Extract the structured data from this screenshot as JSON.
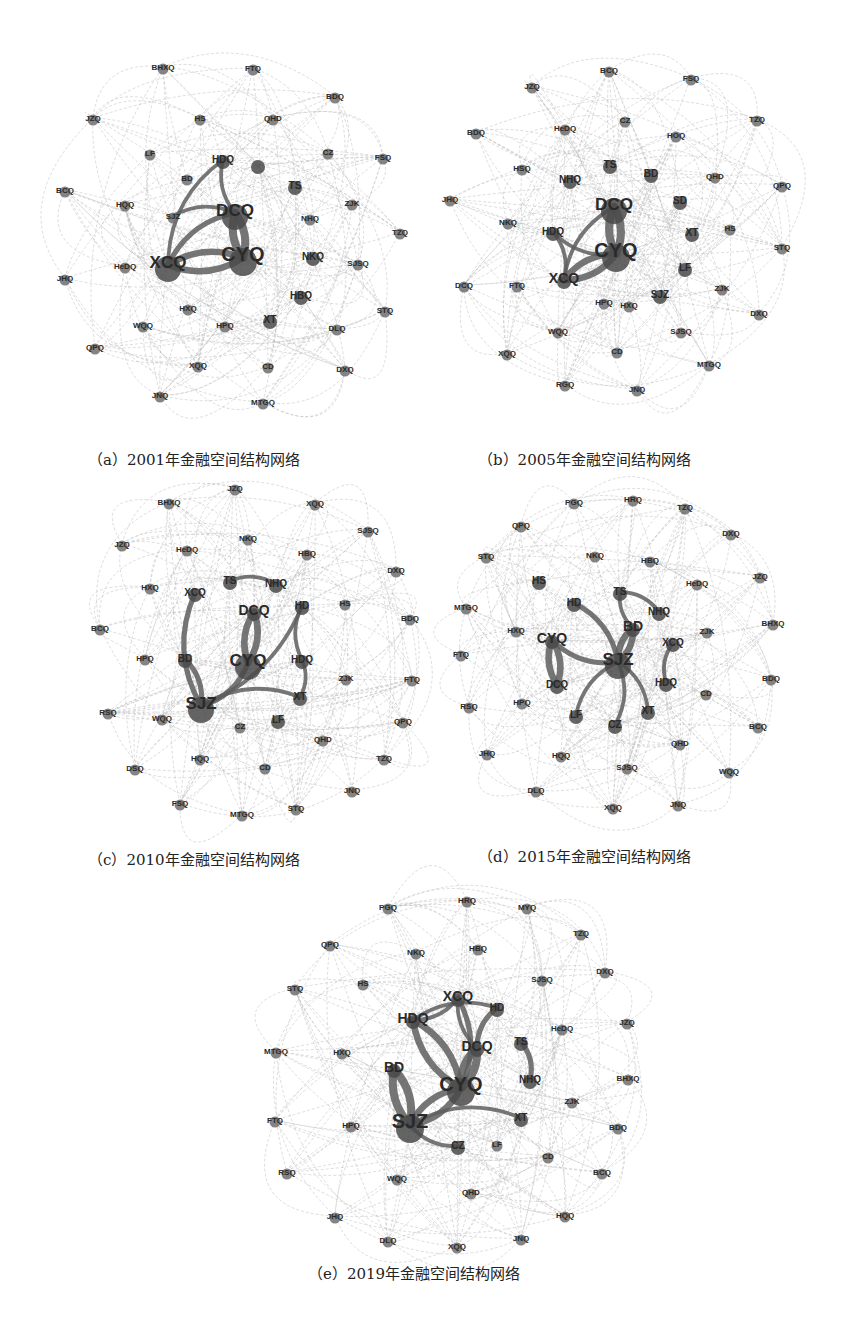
{
  "figure": {
    "panels": [
      {
        "id": "a",
        "caption": "（a）2001年金融空间结构网络",
        "year": 2001,
        "nodes": [
          {
            "label": "BHXQ",
            "w": 1
          },
          {
            "label": "FTQ",
            "w": 1
          },
          {
            "label": "BDQ",
            "w": 1
          },
          {
            "label": "JZQ",
            "w": 1
          },
          {
            "label": "HS",
            "w": 1
          },
          {
            "label": "QHD",
            "w": 1
          },
          {
            "label": "LF",
            "w": 1
          },
          {
            "label": "HDQ",
            "w": 2
          },
          {
            "label": "",
            "w": 2
          },
          {
            "label": "CZ",
            "w": 1
          },
          {
            "label": "FSQ",
            "w": 1
          },
          {
            "label": "BD",
            "w": 1
          },
          {
            "label": "TS",
            "w": 2
          },
          {
            "label": "BCQ",
            "w": 1
          },
          {
            "label": "HQQ",
            "w": 1
          },
          {
            "label": "SJZ",
            "w": 1
          },
          {
            "label": "DCQ",
            "w": 4
          },
          {
            "label": "ZJK",
            "w": 1
          },
          {
            "label": "NHQ",
            "w": 1
          },
          {
            "label": "TZQ",
            "w": 1
          },
          {
            "label": "XCQ",
            "w": 4
          },
          {
            "label": "CYQ",
            "w": 5
          },
          {
            "label": "JHQ",
            "w": 1
          },
          {
            "label": "HeDQ",
            "w": 1
          },
          {
            "label": "NKQ",
            "w": 2
          },
          {
            "label": "SJSQ",
            "w": 1
          },
          {
            "label": "HBQ",
            "w": 2
          },
          {
            "label": "HXQ",
            "w": 1
          },
          {
            "label": "STQ",
            "w": 1
          },
          {
            "label": "WQQ",
            "w": 1
          },
          {
            "label": "HPQ",
            "w": 1
          },
          {
            "label": "XT",
            "w": 2
          },
          {
            "label": "DLQ",
            "w": 1
          },
          {
            "label": "QPQ",
            "w": 1
          },
          {
            "label": "XQQ",
            "w": 1
          },
          {
            "label": "CD",
            "w": 1
          },
          {
            "label": "DXQ",
            "w": 1
          },
          {
            "label": "JNQ",
            "w": 1
          },
          {
            "label": "MTGQ",
            "w": 1
          }
        ],
        "strong_edges": [
          [
            "DCQ",
            "CYQ",
            5
          ],
          [
            "XCQ",
            "CYQ",
            4
          ],
          [
            "XCQ",
            "DCQ",
            3
          ],
          [
            "HDQ",
            "DCQ",
            2
          ],
          [
            "SJZ",
            "DCQ",
            2
          ],
          [
            "HDQ",
            "XCQ",
            2
          ]
        ]
      },
      {
        "id": "b",
        "caption": "（b）2005年金融空间结构网络",
        "year": 2005,
        "nodes": [
          {
            "label": "BCQ",
            "w": 1
          },
          {
            "label": "JZQ",
            "w": 1
          },
          {
            "label": "FSQ",
            "w": 1
          },
          {
            "label": "HeDQ",
            "w": 1
          },
          {
            "label": "CZ",
            "w": 1
          },
          {
            "label": "BDQ",
            "w": 1
          },
          {
            "label": "HOQ",
            "w": 1
          },
          {
            "label": "TZQ",
            "w": 1
          },
          {
            "label": "HSQ",
            "w": 1
          },
          {
            "label": "TS",
            "w": 2
          },
          {
            "label": "NHQ",
            "w": 2
          },
          {
            "label": "BD",
            "w": 2
          },
          {
            "label": "QHD",
            "w": 1
          },
          {
            "label": "QPQ",
            "w": 1
          },
          {
            "label": "JHQ",
            "w": 1
          },
          {
            "label": "SD",
            "w": 2
          },
          {
            "label": "DCQ",
            "w": 4
          },
          {
            "label": "NKQ",
            "w": 1
          },
          {
            "label": "HDQ",
            "w": 2
          },
          {
            "label": "HS",
            "w": 1
          },
          {
            "label": "XT",
            "w": 2
          },
          {
            "label": "CYQ",
            "w": 5
          },
          {
            "label": "STQ",
            "w": 1
          },
          {
            "label": "XCQ",
            "w": 3
          },
          {
            "label": "LF",
            "w": 2
          },
          {
            "label": "ZJK",
            "w": 1
          },
          {
            "label": "DCQ2",
            "w": 1
          },
          {
            "label": "FTQ",
            "w": 1
          },
          {
            "label": "HPQ",
            "w": 1
          },
          {
            "label": "HXQ",
            "w": 1
          },
          {
            "label": "SJZ",
            "w": 2
          },
          {
            "label": "DXQ",
            "w": 1
          },
          {
            "label": "WQQ",
            "w": 1
          },
          {
            "label": "SJSQ",
            "w": 1
          },
          {
            "label": "XQQ",
            "w": 1
          },
          {
            "label": "CD",
            "w": 1
          },
          {
            "label": "MTGQ",
            "w": 1
          },
          {
            "label": "RGQ",
            "w": 1
          },
          {
            "label": "JNQ",
            "w": 1
          }
        ],
        "strong_edges": [
          [
            "DCQ",
            "CYQ",
            5
          ],
          [
            "XCQ",
            "CYQ",
            4
          ],
          [
            "HDQ",
            "XCQ",
            2
          ],
          [
            "HDQ",
            "CYQ",
            2
          ],
          [
            "XCQ",
            "DCQ",
            2
          ]
        ]
      },
      {
        "id": "c",
        "caption": "（c）2010年金融空间结构网络",
        "year": 2010,
        "nodes": [
          {
            "label": "JZQ",
            "w": 1
          },
          {
            "label": "BHXQ",
            "w": 1
          },
          {
            "label": "XQQ",
            "w": 1
          },
          {
            "label": "NKQ",
            "w": 1
          },
          {
            "label": "SJSQ",
            "w": 1
          },
          {
            "label": "JZQ2",
            "w": 1
          },
          {
            "label": "HeDQ",
            "w": 1
          },
          {
            "label": "HBQ",
            "w": 1
          },
          {
            "label": "DXQ",
            "w": 1
          },
          {
            "label": "TS",
            "w": 2
          },
          {
            "label": "NHQ",
            "w": 2
          },
          {
            "label": "HXQ",
            "w": 1
          },
          {
            "label": "XCQ",
            "w": 2
          },
          {
            "label": "HS",
            "w": 1
          },
          {
            "label": "BDQ",
            "w": 1
          },
          {
            "label": "DCQ",
            "w": 3
          },
          {
            "label": "HD",
            "w": 2
          },
          {
            "label": "BCQ",
            "w": 1
          },
          {
            "label": "HPQ",
            "w": 1
          },
          {
            "label": "BD",
            "w": 2
          },
          {
            "label": "CYQ",
            "w": 4
          },
          {
            "label": "HDQ",
            "w": 2
          },
          {
            "label": "ZJK",
            "w": 1
          },
          {
            "label": "FTQ",
            "w": 1
          },
          {
            "label": "SJZ",
            "w": 4
          },
          {
            "label": "XT",
            "w": 2
          },
          {
            "label": "RSQ",
            "w": 1
          },
          {
            "label": "WQQ",
            "w": 1
          },
          {
            "label": "CZ",
            "w": 1
          },
          {
            "label": "LF",
            "w": 2
          },
          {
            "label": "QPQ",
            "w": 1
          },
          {
            "label": "QHD",
            "w": 1
          },
          {
            "label": "HQQ",
            "w": 1
          },
          {
            "label": "TZQ",
            "w": 1
          },
          {
            "label": "DSQ",
            "w": 1
          },
          {
            "label": "CD",
            "w": 1
          },
          {
            "label": "JNQ",
            "w": 1
          },
          {
            "label": "FSQ",
            "w": 1
          },
          {
            "label": "MTGQ",
            "w": 1
          },
          {
            "label": "STQ",
            "w": 1
          }
        ],
        "strong_edges": [
          [
            "DCQ",
            "CYQ",
            4
          ],
          [
            "SJZ",
            "CYQ",
            3
          ],
          [
            "BD",
            "SJZ",
            3
          ],
          [
            "XCQ",
            "SJZ",
            3
          ],
          [
            "TS",
            "NHQ",
            2
          ],
          [
            "SJZ",
            "HD",
            2
          ],
          [
            "SJZ",
            "XT",
            2
          ],
          [
            "HD",
            "HDQ",
            2
          ],
          [
            "HDQ",
            "XT",
            2
          ]
        ]
      },
      {
        "id": "d",
        "caption": "（d）2015年金融空间结构网络",
        "year": 2015,
        "nodes": [
          {
            "label": "PGQ",
            "w": 1
          },
          {
            "label": "HRQ",
            "w": 1
          },
          {
            "label": "TZQ",
            "w": 1
          },
          {
            "label": "QPQ",
            "w": 1
          },
          {
            "label": "DXQ",
            "w": 1
          },
          {
            "label": "STQ",
            "w": 1
          },
          {
            "label": "NKQ",
            "w": 1
          },
          {
            "label": "HBQ",
            "w": 1
          },
          {
            "label": "JZQ",
            "w": 1
          },
          {
            "label": "HS",
            "w": 2
          },
          {
            "label": "HeDQ",
            "w": 1
          },
          {
            "label": "TS",
            "w": 2
          },
          {
            "label": "HD",
            "w": 2
          },
          {
            "label": "NHQ",
            "w": 2
          },
          {
            "label": "MTGQ",
            "w": 1
          },
          {
            "label": "BHXQ",
            "w": 1
          },
          {
            "label": "HXQ",
            "w": 1
          },
          {
            "label": "BD",
            "w": 3
          },
          {
            "label": "ZJK",
            "w": 1
          },
          {
            "label": "CYQ",
            "w": 3
          },
          {
            "label": "XCQ",
            "w": 2
          },
          {
            "label": "FTQ",
            "w": 1
          },
          {
            "label": "SJZ",
            "w": 4
          },
          {
            "label": "BDQ",
            "w": 1
          },
          {
            "label": "DCQ",
            "w": 2
          },
          {
            "label": "HDQ",
            "w": 2
          },
          {
            "label": "CD",
            "w": 1
          },
          {
            "label": "RSQ",
            "w": 1
          },
          {
            "label": "HPQ",
            "w": 1
          },
          {
            "label": "LF",
            "w": 2
          },
          {
            "label": "XT",
            "w": 2
          },
          {
            "label": "CZ",
            "w": 2
          },
          {
            "label": "BCQ",
            "w": 1
          },
          {
            "label": "QHD",
            "w": 1
          },
          {
            "label": "JHQ",
            "w": 1
          },
          {
            "label": "HQQ",
            "w": 1
          },
          {
            "label": "SJSQ",
            "w": 1
          },
          {
            "label": "WQQ",
            "w": 1
          },
          {
            "label": "DLQ",
            "w": 1
          },
          {
            "label": "XQQ",
            "w": 1
          },
          {
            "label": "JNQ",
            "w": 1
          }
        ],
        "strong_edges": [
          [
            "CYQ",
            "DCQ",
            4
          ],
          [
            "SJZ",
            "BD",
            4
          ],
          [
            "HD",
            "SJZ",
            3
          ],
          [
            "CYQ",
            "SJZ",
            3
          ],
          [
            "TS",
            "NHQ",
            2
          ],
          [
            "XCQ",
            "HDQ",
            2
          ],
          [
            "SJZ",
            "XT",
            2
          ],
          [
            "SJZ",
            "LF",
            2
          ],
          [
            "SJZ",
            "CZ",
            2
          ],
          [
            "TS",
            "BD",
            2
          ]
        ]
      },
      {
        "id": "e",
        "caption": "（e）2019年金融空间结构网络",
        "year": 2019,
        "nodes": [
          {
            "label": "HRQ",
            "w": 1
          },
          {
            "label": "PGQ",
            "w": 1
          },
          {
            "label": "MYQ",
            "w": 1
          },
          {
            "label": "TZQ",
            "w": 1
          },
          {
            "label": "QPQ",
            "w": 1
          },
          {
            "label": "NKQ",
            "w": 1
          },
          {
            "label": "HBQ",
            "w": 1
          },
          {
            "label": "DXQ",
            "w": 1
          },
          {
            "label": "SJSQ",
            "w": 1
          },
          {
            "label": "STQ",
            "w": 1
          },
          {
            "label": "HS",
            "w": 1
          },
          {
            "label": "XCQ",
            "w": 3
          },
          {
            "label": "HD",
            "w": 2
          },
          {
            "label": "HDQ",
            "w": 3
          },
          {
            "label": "JZQ",
            "w": 1
          },
          {
            "label": "HeDQ",
            "w": 1
          },
          {
            "label": "TS",
            "w": 2
          },
          {
            "label": "DCQ",
            "w": 3
          },
          {
            "label": "MTGQ",
            "w": 1
          },
          {
            "label": "HXQ",
            "w": 1
          },
          {
            "label": "BD",
            "w": 3
          },
          {
            "label": "NHQ",
            "w": 2
          },
          {
            "label": "CYQ",
            "w": 5
          },
          {
            "label": "BHXQ",
            "w": 1
          },
          {
            "label": "ZJK",
            "w": 1
          },
          {
            "label": "FTQ",
            "w": 1
          },
          {
            "label": "HPQ",
            "w": 1
          },
          {
            "label": "SJZ",
            "w": 5
          },
          {
            "label": "XT",
            "w": 2
          },
          {
            "label": "BDQ",
            "w": 1
          },
          {
            "label": "CZ",
            "w": 2
          },
          {
            "label": "LF",
            "w": 1
          },
          {
            "label": "CD",
            "w": 1
          },
          {
            "label": "RSQ",
            "w": 1
          },
          {
            "label": "BCQ",
            "w": 1
          },
          {
            "label": "WQQ",
            "w": 1
          },
          {
            "label": "QHD",
            "w": 1
          },
          {
            "label": "JHQ",
            "w": 1
          },
          {
            "label": "HQQ",
            "w": 1
          },
          {
            "label": "DLQ",
            "w": 1
          },
          {
            "label": "XQQ",
            "w": 1
          },
          {
            "label": "JNQ",
            "w": 1
          }
        ],
        "strong_edges": [
          [
            "CYQ",
            "DCQ",
            5
          ],
          [
            "SJZ",
            "BD",
            5
          ],
          [
            "SJZ",
            "CYQ",
            4
          ],
          [
            "HDQ",
            "CYQ",
            4
          ],
          [
            "XCQ",
            "CYQ",
            3
          ],
          [
            "HD",
            "DCQ",
            3
          ],
          [
            "TS",
            "NHQ",
            3
          ],
          [
            "HDQ",
            "XCQ",
            2
          ],
          [
            "SJZ",
            "XT",
            2
          ],
          [
            "SJZ",
            "CZ",
            2
          ],
          [
            "HDQ",
            "HD",
            2
          ],
          [
            "XCQ",
            "DCQ",
            2
          ]
        ]
      }
    ]
  }
}
